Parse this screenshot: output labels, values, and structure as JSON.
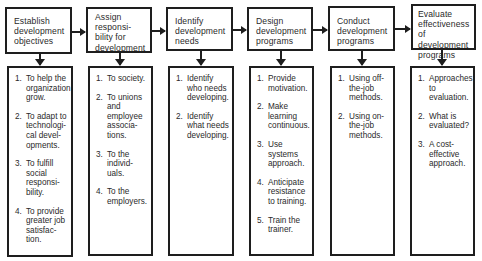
{
  "steps": [
    {
      "title": "Establish\ndevelopment\nobjectives",
      "items": [
        {
          "num": "1.",
          "text": "To help the\norganization\ngrow."
        },
        {
          "num": "2.",
          "text": "To adapt to\ntechnologi-\ncal devel-\nopments."
        },
        {
          "num": "3.",
          "text": "To fulfill\nsocial\nresponsi-\nbility."
        },
        {
          "num": "4.",
          "text": "To provide\ngreater job\nsatisfac-\ntion."
        }
      ]
    },
    {
      "title": "Assign\nresponsi-\nbility for\ndevelopment",
      "items": [
        {
          "num": "1.",
          "text": "To society."
        },
        {
          "num": "2.",
          "text": "To unions\nand\nemployee\nassocia-\ntions."
        },
        {
          "num": "3.",
          "text": "To the\nindivid-\nuals."
        },
        {
          "num": "4.",
          "text": "To the\nemployers."
        }
      ]
    },
    {
      "title": "Identify\ndevelopment\nneeds",
      "items": [
        {
          "num": "1.",
          "text": "Identify\nwho needs\ndeveloping."
        },
        {
          "num": "2.",
          "text": "Identify\nwhat needs\ndeveloping."
        }
      ]
    },
    {
      "title": "Design\ndevelopment\nprograms",
      "items": [
        {
          "num": "1.",
          "text": "Provide\nmotivation."
        },
        {
          "num": "2.",
          "text": "Make\nlearning\ncontinuous."
        },
        {
          "num": "3.",
          "text": "Use systems\napproach."
        },
        {
          "num": "4.",
          "text": "Anticipate\nresistance\nto training."
        },
        {
          "num": "5.",
          "text": "Train the\ntrainer."
        }
      ]
    },
    {
      "title": "Conduct\ndevelopment\nprograms",
      "items": [
        {
          "num": "1.",
          "text": "Using off-\nthe-job\nmethods."
        },
        {
          "num": "2.",
          "text": "Using on-\nthe-job\nmethods."
        }
      ]
    },
    {
      "title": "Evaluate\neffectiveness\nof development\nprograms",
      "items": [
        {
          "num": "1.",
          "text": "Approaches\nto\nevaluation."
        },
        {
          "num": "2.",
          "text": "What is\nevaluated?"
        },
        {
          "num": "3.",
          "text": "A cost-\neffective\napproach."
        }
      ]
    }
  ]
}
